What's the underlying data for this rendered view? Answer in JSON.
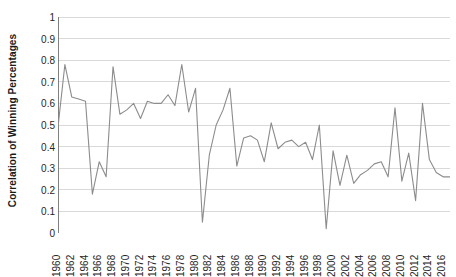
{
  "chart_data": {
    "type": "line",
    "title": "",
    "xlabel": "",
    "ylabel": "Correlation of Winning Percentages",
    "ylim": [
      0,
      1
    ],
    "ytick_labels": [
      "0",
      "0.1",
      "0.2",
      "0.3",
      "0.4",
      "0.5",
      "0.6",
      "0.7",
      "0.8",
      "0.9",
      "1"
    ],
    "ytick_values": [
      0,
      0.1,
      0.2,
      0.3,
      0.4,
      0.5,
      0.6,
      0.7,
      0.8,
      0.9,
      1
    ],
    "xlim": [
      1960,
      2017
    ],
    "xtick_labels": [
      "1960",
      "1962",
      "1964",
      "1966",
      "1968",
      "1970",
      "1972",
      "1974",
      "1976",
      "1978",
      "1980",
      "1982",
      "1984",
      "1986",
      "1988",
      "1990",
      "1992",
      "1994",
      "1996",
      "1998",
      "2000",
      "2002",
      "2004",
      "2006",
      "2008",
      "2010",
      "2012",
      "2014",
      "2016"
    ],
    "xtick_values": [
      1960,
      1962,
      1964,
      1966,
      1968,
      1970,
      1972,
      1974,
      1976,
      1978,
      1980,
      1982,
      1984,
      1986,
      1988,
      1990,
      1992,
      1994,
      1996,
      1998,
      2000,
      2002,
      2004,
      2006,
      2008,
      2010,
      2012,
      2014,
      2016
    ],
    "grid": "horizontal",
    "legend": "none",
    "line_color": "#8c8c8c",
    "grid_color": "#d9d9d9",
    "axis_color": "#808080",
    "x": [
      1960,
      1961,
      1962,
      1963,
      1964,
      1965,
      1966,
      1967,
      1968,
      1969,
      1970,
      1971,
      1972,
      1973,
      1974,
      1975,
      1976,
      1977,
      1978,
      1979,
      1980,
      1981,
      1982,
      1983,
      1984,
      1985,
      1986,
      1987,
      1988,
      1989,
      1990,
      1991,
      1992,
      1993,
      1994,
      1995,
      1996,
      1997,
      1998,
      1999,
      2000,
      2001,
      2002,
      2003,
      2004,
      2005,
      2006,
      2007,
      2008,
      2009,
      2010,
      2011,
      2012,
      2013,
      2014,
      2015,
      2016,
      2017
    ],
    "values": [
      0.49,
      0.78,
      0.63,
      0.62,
      0.61,
      0.18,
      0.33,
      0.26,
      0.77,
      0.55,
      0.57,
      0.6,
      0.53,
      0.61,
      0.6,
      0.6,
      0.64,
      0.59,
      0.78,
      0.56,
      0.67,
      0.05,
      0.36,
      0.5,
      0.57,
      0.67,
      0.31,
      0.44,
      0.45,
      0.43,
      0.33,
      0.51,
      0.39,
      0.42,
      0.43,
      0.4,
      0.42,
      0.34,
      0.5,
      0.02,
      0.38,
      0.22,
      0.36,
      0.23,
      0.27,
      0.29,
      0.32,
      0.33,
      0.26,
      0.58,
      0.24,
      0.37,
      0.15,
      0.6,
      0.34,
      0.28,
      0.26,
      0.26
    ],
    "series": [
      {
        "name": "Correlation of Winning Percentages",
        "values": [
          0.49,
          0.78,
          0.63,
          0.62,
          0.61,
          0.18,
          0.33,
          0.26,
          0.77,
          0.55,
          0.57,
          0.6,
          0.53,
          0.61,
          0.6,
          0.6,
          0.64,
          0.59,
          0.78,
          0.56,
          0.67,
          0.05,
          0.36,
          0.5,
          0.57,
          0.67,
          0.31,
          0.44,
          0.45,
          0.43,
          0.33,
          0.51,
          0.39,
          0.42,
          0.43,
          0.4,
          0.42,
          0.34,
          0.5,
          0.02,
          0.38,
          0.22,
          0.36,
          0.23,
          0.27,
          0.29,
          0.32,
          0.33,
          0.26,
          0.58,
          0.24,
          0.37,
          0.15,
          0.6,
          0.34,
          0.28,
          0.26,
          0.26
        ]
      }
    ]
  }
}
